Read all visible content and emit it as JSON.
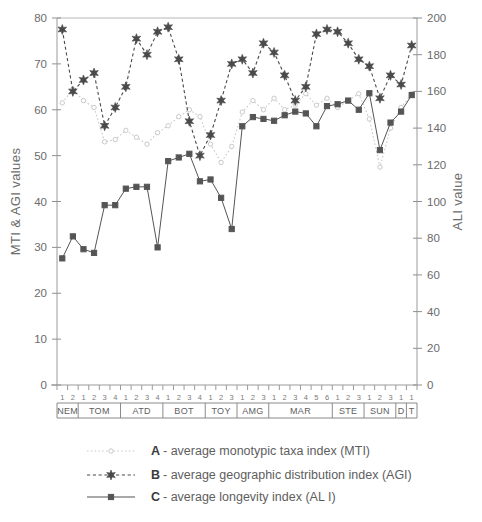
{
  "chart_data": {
    "type": "line",
    "title": "",
    "xlabel": "",
    "ylabel": "MTI & AGI values",
    "y2label": "ALI value",
    "ylim": [
      0,
      80
    ],
    "y2lim": [
      0,
      200
    ],
    "yticks": [
      0,
      10,
      20,
      30,
      40,
      50,
      60,
      70,
      80
    ],
    "y2ticks": [
      0,
      20,
      40,
      60,
      80,
      100,
      120,
      140,
      160,
      180,
      200
    ],
    "grid": false,
    "legend_position": "below-axis",
    "x_subtick_labels": [
      "1",
      "2",
      "1",
      "2",
      "3",
      "4",
      "1",
      "2",
      "3",
      "4",
      "1",
      "2",
      "3",
      "4",
      "1",
      "2",
      "3",
      "1",
      "2",
      "3",
      "1",
      "2",
      "3",
      "4",
      "5",
      "6",
      "1",
      "2",
      "3",
      "1",
      "2",
      "3",
      "1",
      "1"
    ],
    "x_groups": [
      {
        "label": "NEM",
        "count": 2
      },
      {
        "label": "TOM",
        "count": 4
      },
      {
        "label": "ATD",
        "count": 4
      },
      {
        "label": "BOT",
        "count": 4
      },
      {
        "label": "TOY",
        "count": 3
      },
      {
        "label": "AMG",
        "count": 3
      },
      {
        "label": "MAR",
        "count": 6
      },
      {
        "label": "STE",
        "count": 3
      },
      {
        "label": "SUN",
        "count": 3
      },
      {
        "label": "D",
        "count": 1
      },
      {
        "label": "T",
        "count": 1
      }
    ],
    "series": [
      {
        "name": "A- average monotypic taxa index (MTI)",
        "key": "A",
        "short": "MTI",
        "axis": "left",
        "color": "#c9c9c9",
        "marker": "open-circle",
        "linestyle": "dotted",
        "values": [
          61.5,
          64.5,
          62.0,
          60.5,
          53.0,
          53.5,
          55.5,
          54.0,
          52.5,
          55.0,
          56.5,
          58.5,
          60.0,
          58.5,
          52.5,
          48.5,
          52.0,
          59.5,
          62.0,
          60.0,
          62.5,
          60.0,
          61.0,
          63.5,
          61.0,
          62.5,
          60.5,
          62.0,
          63.5,
          58.0,
          47.5,
          56.0,
          60.5,
          63.5
        ]
      },
      {
        "name": "B- average geographic distribution index (AGI)",
        "key": "B",
        "short": "AGI",
        "axis": "left",
        "color": "#4a4a4a",
        "marker": "star",
        "linestyle": "dashed",
        "values": [
          77.5,
          64.0,
          66.5,
          68.0,
          56.5,
          60.5,
          65.0,
          75.5,
          72.0,
          77.0,
          78.0,
          71.0,
          57.5,
          50.0,
          54.5,
          62.0,
          70.0,
          71.0,
          68.0,
          74.5,
          72.5,
          67.5,
          62.0,
          65.0,
          76.5,
          77.5,
          77.0,
          74.5,
          71.0,
          69.5,
          62.5,
          67.5,
          65.5,
          74.0
        ]
      },
      {
        "name": "C- average longevity index (AL I)",
        "key": "C",
        "short": "ALI",
        "axis": "right",
        "color": "#555555",
        "marker": "filled-square",
        "linestyle": "solid",
        "values": [
          69,
          81,
          74,
          72,
          98,
          98,
          107,
          108,
          108,
          75,
          122,
          124,
          126,
          111,
          112,
          102,
          85,
          141,
          146,
          145,
          144,
          147,
          149,
          148,
          141,
          152,
          153,
          155,
          150,
          159,
          128,
          143,
          149,
          158
        ]
      }
    ]
  },
  "legend": {
    "items": [
      {
        "key": "A",
        "text": "- average monotypic taxa index (MTI)"
      },
      {
        "key": "B",
        "text": "- average geographic distribution index (AGI)"
      },
      {
        "key": "C",
        "text": "- average longevity index (AL I)"
      }
    ]
  }
}
